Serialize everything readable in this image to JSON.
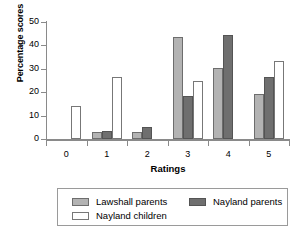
{
  "chart_data": {
    "type": "bar",
    "title": "",
    "xlabel": "Ratings",
    "ylabel": "Percentage scores",
    "categories": [
      "0",
      "1",
      "2",
      "3",
      "4",
      "5"
    ],
    "series": [
      {
        "name": "Lawshall parents",
        "color": "#b3b3b3",
        "values": [
          0,
          3,
          3,
          43.5,
          30.2,
          19.2
        ]
      },
      {
        "name": "Nayland parents",
        "color": "#6f6f6f",
        "values": [
          0,
          3.5,
          5.1,
          18.2,
          44.5,
          26.5
        ]
      },
      {
        "name": "Nayland children",
        "color": "#ffffff",
        "values": [
          14.2,
          26.4,
          0,
          24.8,
          0,
          33.4
        ]
      }
    ],
    "ylim": [
      0,
      50
    ],
    "yticks": [
      0,
      10,
      20,
      30,
      40,
      50
    ],
    "ytick_labels": [
      "0",
      "10",
      "20",
      "30",
      "40",
      "50"
    ],
    "grid": false,
    "legend_position": "bottom",
    "legend_order": [
      "Lawshall parents",
      "Nayland children",
      "Nayland parents"
    ]
  },
  "axes": {
    "y_title": "Percentage scores",
    "x_title": "Ratings"
  },
  "legend": {
    "items": [
      {
        "label": "Lawshall parents"
      },
      {
        "label": "Nayland children"
      },
      {
        "label": "Nayland parents"
      }
    ]
  }
}
